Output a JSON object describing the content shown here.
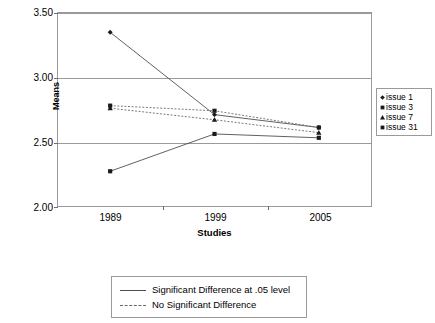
{
  "chart_data": {
    "type": "line",
    "title": "",
    "xlabel": "Studies",
    "ylabel": "Means",
    "categories": [
      "1989",
      "1999",
      "2005"
    ],
    "ylim": [
      2.0,
      3.5
    ],
    "yticks": [
      2.0,
      2.5,
      3.0,
      3.5
    ],
    "ytick_labels": [
      "2.00",
      "2.50",
      "3.00",
      "3.50"
    ],
    "grid": true,
    "legend_position": "right",
    "series": [
      {
        "name": "issue 1",
        "marker": "diamond",
        "line_style": "solid",
        "significance": "Significant Difference at .05 level",
        "values": [
          3.35,
          2.71,
          2.61
        ]
      },
      {
        "name": "issue 3",
        "marker": "square",
        "line_style": "dashed",
        "significance": "No Significant Difference",
        "values": [
          2.78,
          2.74,
          2.61
        ]
      },
      {
        "name": "issue 7",
        "marker": "triangle",
        "line_style": "dashed",
        "significance": "No Significant Difference",
        "values": [
          2.76,
          2.67,
          2.57
        ]
      },
      {
        "name": "issue 31",
        "marker": "square",
        "line_style": "solid",
        "significance": "Significant Difference at .05 level",
        "values": [
          2.27,
          2.56,
          2.53
        ]
      }
    ],
    "style_legend": [
      {
        "label": "Significant Difference at .05 level",
        "line_style": "solid"
      },
      {
        "label": "No Significant Difference",
        "line_style": "dashed"
      }
    ],
    "colors": {
      "line": "#4d4d4d",
      "dashed_line": "#6a6a6a",
      "marker": "#1a1a1a",
      "axis": "#9a9a9a",
      "grid": "#9a9a9a",
      "text": "#000000",
      "background": "#ffffff"
    }
  }
}
